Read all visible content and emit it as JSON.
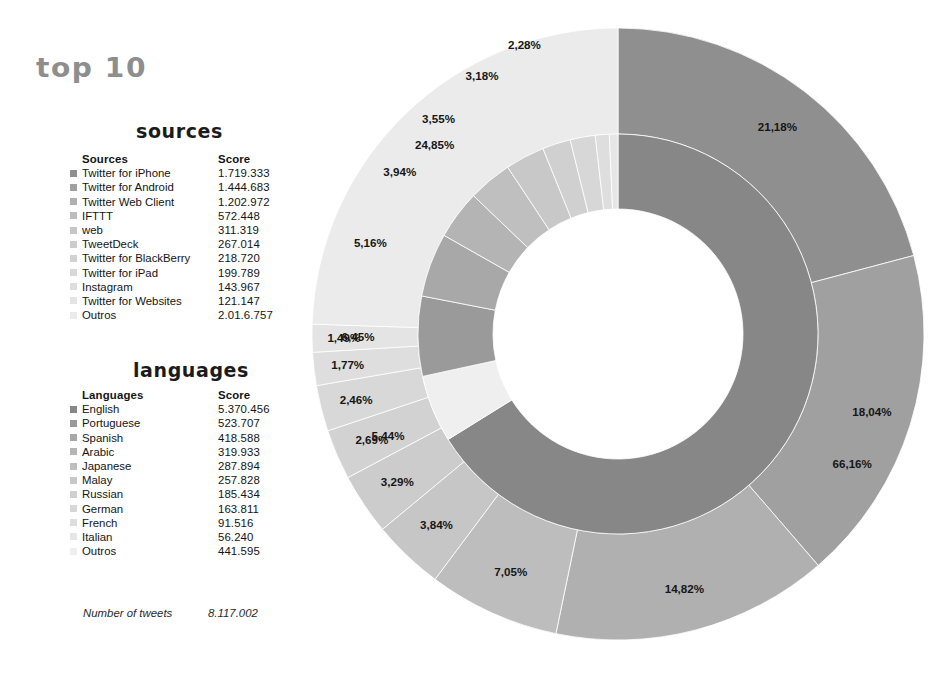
{
  "report": {
    "title": "top 10",
    "sources_heading": "sources",
    "languages_heading": "languages",
    "total_label": "Number of tweets",
    "total_value": "8.117.002"
  },
  "sources_table": {
    "col_label": "Sources",
    "col_score": "Score",
    "rows": [
      {
        "label": "Twitter for iPhone",
        "score": "1.719.333",
        "color": "#8f8f8f",
        "percent": "21,18%"
      },
      {
        "label": "Twitter for Android",
        "score": "1.444.683",
        "color": "#a0a0a0",
        "percent": "18,04%"
      },
      {
        "label": "Twitter Web Client",
        "score": "1.202.972",
        "color": "#b0b0b0",
        "percent": "14,82%"
      },
      {
        "label": "IFTTT",
        "score": "572.448",
        "color": "#bdbdbd",
        "percent": "7,05%"
      },
      {
        "label": "web",
        "score": "311.319",
        "color": "#c6c6c6",
        "percent": "3,84%"
      },
      {
        "label": "TweetDeck",
        "score": "267.014",
        "color": "#cccccc",
        "percent": "3,29%"
      },
      {
        "label": "Twitter for BlackBerry",
        "score": "218.720",
        "color": "#d2d2d2",
        "percent": "2,69%"
      },
      {
        "label": "Twitter for iPad",
        "score": "199.789",
        "color": "#d8d8d8",
        "percent": "2,46%"
      },
      {
        "label": "Instagram",
        "score": "143.967",
        "color": "#dedede",
        "percent": "1,77%"
      },
      {
        "label": "Twitter for Websites",
        "score": "121.147",
        "color": "#e4e4e4",
        "percent": "1,49%"
      },
      {
        "label": "Outros",
        "score": "2.01.6.757",
        "color": "#ebebeb",
        "percent": "24,85%"
      }
    ]
  },
  "languages_table": {
    "col_label": "Languages",
    "col_score": "Score",
    "rows": [
      {
        "label": "English",
        "score": "5.370.456",
        "color": "#878787",
        "percent": "66,16%"
      },
      {
        "label": "Portuguese",
        "score": "523.707",
        "color": "#9a9a9a",
        "percent": "6,45%"
      },
      {
        "label": "Spanish",
        "score": "418.588",
        "color": "#a8a8a8",
        "percent": "5,16%"
      },
      {
        "label": "Arabic",
        "score": "319.933",
        "color": "#b4b4b4",
        "percent": "3,94%"
      },
      {
        "label": "Japanese",
        "score": "287.894",
        "color": "#bfbfbf",
        "percent": "3,55%"
      },
      {
        "label": "Malay",
        "score": "257.828",
        "color": "#c8c8c8",
        "percent": "3,18%"
      },
      {
        "label": "Russian",
        "score": "185.434",
        "color": "#d0d0d0",
        "percent": "2,28%"
      },
      {
        "label": "German",
        "score": "163.811",
        "color": "#d7d7d7",
        "percent": "2,02%"
      },
      {
        "label": "French",
        "score": "91.516",
        "color": "#dedede",
        "percent": "1,13%"
      },
      {
        "label": "Italian",
        "score": "56.240",
        "color": "#e6e6e6",
        "percent": "0,69%"
      },
      {
        "label": "Outros",
        "score": "441.595",
        "color": "#efefef",
        "percent": "5,44%"
      }
    ]
  },
  "chart_data": {
    "type": "pie",
    "title": "top 10",
    "variant": "double-ring-donut",
    "legend_position": "left-tables",
    "label_format": "percent-comma-decimal",
    "rings": [
      {
        "name": "languages",
        "ring": "inner",
        "inner_radius_px": 125,
        "outer_radius_px": 200,
        "start_angle_deg": 0,
        "direction": "clockwise",
        "categories": [
          "English",
          "Outros",
          "Portuguese",
          "Spanish",
          "Arabic",
          "Japanese",
          "Malay",
          "Russian",
          "German",
          "French",
          "Italian"
        ],
        "values": [
          66.16,
          5.44,
          6.45,
          5.16,
          3.94,
          3.55,
          3.18,
          2.28,
          2.02,
          1.13,
          0.69
        ],
        "labels": [
          "66,16%",
          "5,44%",
          "6,45%",
          "5,16%",
          "3,94%",
          "3,55%",
          "3,18%",
          "2,28%",
          "2,02%",
          "1,13%",
          "0,69%"
        ],
        "colors": [
          "#878787",
          "#efefef",
          "#9a9a9a",
          "#a8a8a8",
          "#b4b4b4",
          "#bfbfbf",
          "#c8c8c8",
          "#d0d0d0",
          "#d7d7d7",
          "#dedede",
          "#e6e6e6"
        ]
      },
      {
        "name": "sources",
        "ring": "outer",
        "inner_radius_px": 200,
        "outer_radius_px": 306,
        "start_angle_deg": 0,
        "direction": "clockwise",
        "categories": [
          "Twitter for iPhone",
          "Twitter for Android",
          "Twitter Web Client",
          "IFTTT",
          "web",
          "TweetDeck",
          "Twitter for BlackBerry",
          "Twitter for iPad",
          "Instagram",
          "Twitter for Websites",
          "Outros"
        ],
        "values": [
          21.18,
          18.04,
          14.82,
          7.05,
          3.84,
          3.29,
          2.69,
          2.46,
          1.77,
          1.49,
          24.85
        ],
        "labels": [
          "21,18%",
          "18,04%",
          "14,82%",
          "7,05%",
          "3,84%",
          "3,29%",
          "2,69%",
          "2,46%",
          "1,77%",
          "1,49%",
          "24,85%"
        ],
        "colors": [
          "#8f8f8f",
          "#a0a0a0",
          "#b0b0b0",
          "#bdbdbd",
          "#c6c6c6",
          "#cccccc",
          "#d2d2d2",
          "#d8d8d8",
          "#dedede",
          "#e4e4e4",
          "#ebebeb"
        ]
      }
    ]
  }
}
